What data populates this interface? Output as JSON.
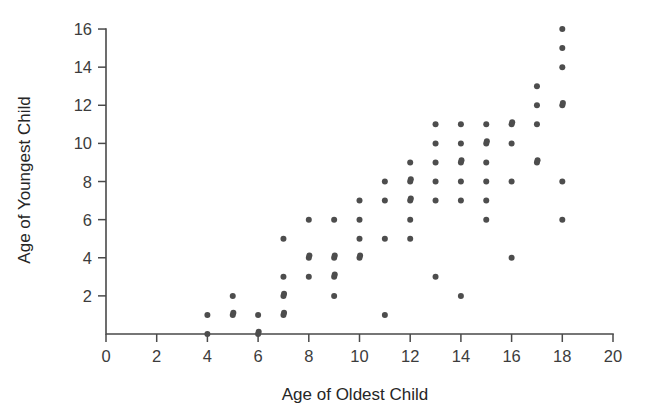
{
  "chart_data": {
    "type": "scatter",
    "title": "",
    "xlabel": "Age of Oldest Child",
    "ylabel": "Age of Youngest Child",
    "xlim": [
      0,
      20
    ],
    "ylim": [
      0,
      16
    ],
    "xticks": [
      0,
      2,
      4,
      6,
      8,
      10,
      12,
      14,
      16,
      18,
      20
    ],
    "yticks": [
      2,
      4,
      6,
      8,
      10,
      12,
      14,
      16
    ],
    "xtick_labels": [
      "0",
      "2",
      "4",
      "6",
      "8",
      "10",
      "12",
      "14",
      "16",
      "18",
      "20"
    ],
    "ytick_labels": [
      "2",
      "4",
      "6",
      "8",
      "10",
      "12",
      "14",
      "16"
    ],
    "grid": false,
    "legend": null,
    "marker": "circle",
    "marker_color": "#4d4d4d",
    "points": [
      {
        "x": 4,
        "y": 0
      },
      {
        "x": 4,
        "y": 1
      },
      {
        "x": 5,
        "y": 1
      },
      {
        "x": 5,
        "y": 1
      },
      {
        "x": 5,
        "y": 2
      },
      {
        "x": 6,
        "y": 0
      },
      {
        "x": 6,
        "y": 0
      },
      {
        "x": 6,
        "y": 1
      },
      {
        "x": 7,
        "y": 1
      },
      {
        "x": 7,
        "y": 1
      },
      {
        "x": 7,
        "y": 2
      },
      {
        "x": 7,
        "y": 2
      },
      {
        "x": 7,
        "y": 3
      },
      {
        "x": 7,
        "y": 5
      },
      {
        "x": 8,
        "y": 3
      },
      {
        "x": 8,
        "y": 4
      },
      {
        "x": 8,
        "y": 4
      },
      {
        "x": 8,
        "y": 6
      },
      {
        "x": 9,
        "y": 2
      },
      {
        "x": 9,
        "y": 3
      },
      {
        "x": 9,
        "y": 3
      },
      {
        "x": 9,
        "y": 4
      },
      {
        "x": 9,
        "y": 4
      },
      {
        "x": 9,
        "y": 6
      },
      {
        "x": 10,
        "y": 4
      },
      {
        "x": 10,
        "y": 4
      },
      {
        "x": 10,
        "y": 5
      },
      {
        "x": 10,
        "y": 6
      },
      {
        "x": 10,
        "y": 7
      },
      {
        "x": 11,
        "y": 1
      },
      {
        "x": 11,
        "y": 5
      },
      {
        "x": 11,
        "y": 7
      },
      {
        "x": 11,
        "y": 8
      },
      {
        "x": 12,
        "y": 5
      },
      {
        "x": 12,
        "y": 6
      },
      {
        "x": 12,
        "y": 7
      },
      {
        "x": 12,
        "y": 7
      },
      {
        "x": 12,
        "y": 8
      },
      {
        "x": 12,
        "y": 8
      },
      {
        "x": 12,
        "y": 9
      },
      {
        "x": 13,
        "y": 3
      },
      {
        "x": 13,
        "y": 7
      },
      {
        "x": 13,
        "y": 8
      },
      {
        "x": 13,
        "y": 9
      },
      {
        "x": 13,
        "y": 10
      },
      {
        "x": 13,
        "y": 11
      },
      {
        "x": 14,
        "y": 2
      },
      {
        "x": 14,
        "y": 7
      },
      {
        "x": 14,
        "y": 8
      },
      {
        "x": 14,
        "y": 9
      },
      {
        "x": 14,
        "y": 9
      },
      {
        "x": 14,
        "y": 10
      },
      {
        "x": 14,
        "y": 11
      },
      {
        "x": 15,
        "y": 6
      },
      {
        "x": 15,
        "y": 7
      },
      {
        "x": 15,
        "y": 8
      },
      {
        "x": 15,
        "y": 9
      },
      {
        "x": 15,
        "y": 10
      },
      {
        "x": 15,
        "y": 10
      },
      {
        "x": 15,
        "y": 11
      },
      {
        "x": 16,
        "y": 4
      },
      {
        "x": 16,
        "y": 8
      },
      {
        "x": 16,
        "y": 10
      },
      {
        "x": 16,
        "y": 11
      },
      {
        "x": 16,
        "y": 11
      },
      {
        "x": 17,
        "y": 9
      },
      {
        "x": 17,
        "y": 9
      },
      {
        "x": 17,
        "y": 11
      },
      {
        "x": 17,
        "y": 12
      },
      {
        "x": 17,
        "y": 13
      },
      {
        "x": 18,
        "y": 6
      },
      {
        "x": 18,
        "y": 8
      },
      {
        "x": 18,
        "y": 12
      },
      {
        "x": 18,
        "y": 12
      },
      {
        "x": 18,
        "y": 14
      },
      {
        "x": 18,
        "y": 15
      },
      {
        "x": 18,
        "y": 16
      }
    ]
  },
  "axes": {
    "x_title": "Age of Oldest Child",
    "y_title": "Age of Youngest Child"
  }
}
